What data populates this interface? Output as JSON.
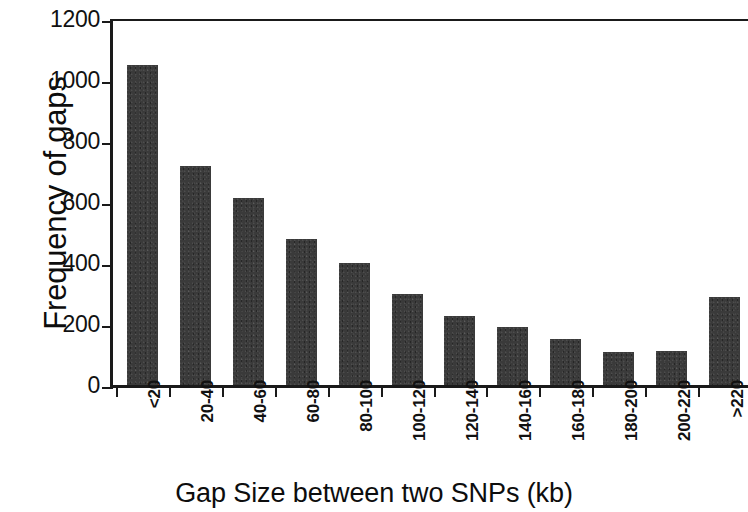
{
  "chart_data": {
    "type": "bar",
    "title": "",
    "xlabel": "Gap Size between two SNPs (kb)",
    "ylabel": "Frequency of gaps",
    "categories": [
      "<20",
      "20-40",
      "40-60",
      "60-80",
      "80-100",
      "100-120",
      "120-140",
      "140-160",
      "160-180",
      "180-200",
      "200-220",
      ">220"
    ],
    "values": [
      1050,
      717,
      613,
      478,
      400,
      300,
      225,
      190,
      150,
      108,
      112,
      290
    ],
    "ylim": [
      0,
      1200
    ],
    "ytick_values": [
      0,
      200,
      400,
      600,
      800,
      1000,
      1200
    ],
    "ytick_labels": [
      "0",
      "200",
      "400",
      "600",
      "800",
      "1000",
      "1200"
    ],
    "grid": false,
    "legend": null,
    "bar_color": "#3a3a3a",
    "axis_color": "#1a1a1a",
    "background_color": "#ffffff"
  }
}
